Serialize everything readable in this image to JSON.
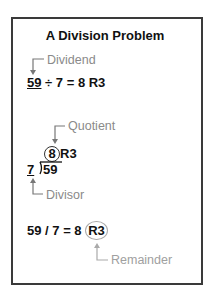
{
  "title": "A Division Problem",
  "section1": {
    "label": "Dividend",
    "dividend": "59",
    "rest": "÷ 7 = 8 R3"
  },
  "section2": {
    "quotient_label": "Quotient",
    "quotient": "8",
    "remainder": "R3",
    "divisor": "7",
    "dividend": "59",
    "divisor_label": "Divisor"
  },
  "section3": {
    "expr": "59 / 7 = 8",
    "remainder": "R3",
    "remainder_label": "Remainder"
  },
  "colors": {
    "text": "#111111",
    "label": "#8a8a8a",
    "frame": "#3a3a3a"
  }
}
